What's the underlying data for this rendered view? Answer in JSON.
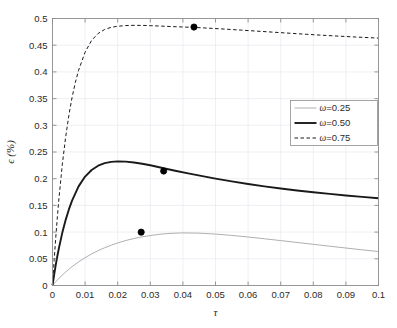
{
  "chart_data": {
    "type": "line",
    "title": "",
    "xlabel": "τ",
    "ylabel": "ϵ (%)",
    "xlim": [
      0,
      0.1
    ],
    "ylim": [
      0,
      0.5
    ],
    "grid": true,
    "legend_position": "center-right",
    "xticks": [
      "0",
      "0.01",
      "0.02",
      "0.03",
      "0.04",
      "0.05",
      "0.06",
      "0.07",
      "0.08",
      "0.09",
      "0.1"
    ],
    "xtick_values": [
      0,
      0.01,
      0.02,
      0.03,
      0.04,
      0.05,
      0.06,
      0.07,
      0.08,
      0.09,
      0.1
    ],
    "yticks": [
      "0",
      "0.05",
      "0.1",
      "0.15",
      "0.2",
      "0.25",
      "0.3",
      "0.35",
      "0.4",
      "0.45",
      "0.5"
    ],
    "ytick_values": [
      0,
      0.05,
      0.1,
      0.15,
      0.2,
      0.25,
      0.3,
      0.35,
      0.4,
      0.45,
      0.5
    ],
    "series": [
      {
        "name": "ω=0.25",
        "legend_label": "ω=0.25",
        "style": "thin-solid",
        "color": "#9a9a9a",
        "width": 0.8,
        "dash": "",
        "peak_marker": {
          "x": 0.0272,
          "y": 0.0999,
          "label": "peak"
        },
        "x": [
          0,
          0.0005,
          0.001,
          0.002,
          0.003,
          0.004,
          0.005,
          0.006,
          0.008,
          0.01,
          0.012,
          0.014,
          0.016,
          0.018,
          0.02,
          0.0225,
          0.025,
          0.0272,
          0.03,
          0.033,
          0.036,
          0.04,
          0.045,
          0.05,
          0.055,
          0.06,
          0.065,
          0.07,
          0.075,
          0.08,
          0.085,
          0.09,
          0.095,
          0.1
        ],
        "y": [
          0,
          0.0036,
          0.007,
          0.0134,
          0.0194,
          0.025,
          0.0303,
          0.0352,
          0.0442,
          0.0521,
          0.0591,
          0.0653,
          0.0707,
          0.0755,
          0.0797,
          0.0843,
          0.088,
          0.0908,
          0.0936,
          0.096,
          0.0976,
          0.0985,
          0.098,
          0.0963,
          0.0938,
          0.0908,
          0.0875,
          0.0841,
          0.0806,
          0.0771,
          0.0736,
          0.0702,
          0.0668,
          0.0636
        ]
      },
      {
        "name": "ω=0.50",
        "legend_label": "ω=0.50",
        "style": "thick-solid",
        "color": "#1a1a1a",
        "width": 1.9,
        "dash": "",
        "peak_marker": {
          "x": 0.0341,
          "y": 0.2143,
          "label": "peak"
        },
        "x": [
          0,
          0.0005,
          0.001,
          0.0015,
          0.002,
          0.003,
          0.004,
          0.005,
          0.006,
          0.008,
          0.01,
          0.012,
          0.014,
          0.016,
          0.018,
          0.02,
          0.0225,
          0.025,
          0.0275,
          0.03,
          0.0341,
          0.038,
          0.042,
          0.046,
          0.05,
          0.055,
          0.06,
          0.065,
          0.07,
          0.075,
          0.08,
          0.085,
          0.09,
          0.095,
          0.1
        ],
        "y": [
          0,
          0.02,
          0.0385,
          0.0554,
          0.071,
          0.0986,
          0.122,
          0.142,
          0.159,
          0.1856,
          0.204,
          0.2163,
          0.2243,
          0.2291,
          0.2316,
          0.2325,
          0.232,
          0.2304,
          0.228,
          0.2251,
          0.2196,
          0.2145,
          0.2095,
          0.2047,
          0.2001,
          0.1949,
          0.1901,
          0.1857,
          0.1817,
          0.178,
          0.1746,
          0.1715,
          0.1686,
          0.1659,
          0.1634
        ]
      },
      {
        "name": "ω=0.75",
        "legend_label": "ω=0.75",
        "style": "dashed",
        "color": "#1a1a1a",
        "width": 1.0,
        "dash": "3.5,2.5",
        "peak_marker": {
          "x": 0.0434,
          "y": 0.484,
          "label": "peak"
        },
        "x": [
          0,
          0.0005,
          0.001,
          0.0015,
          0.002,
          0.003,
          0.004,
          0.005,
          0.006,
          0.007,
          0.008,
          0.01,
          0.012,
          0.014,
          0.016,
          0.018,
          0.02,
          0.0225,
          0.025,
          0.0275,
          0.03,
          0.0335,
          0.037,
          0.0434,
          0.048,
          0.053,
          0.058,
          0.063,
          0.068,
          0.073,
          0.078,
          0.083,
          0.088,
          0.093,
          0.1
        ],
        "y": [
          0,
          0.047,
          0.09,
          0.129,
          0.1645,
          0.226,
          0.2765,
          0.318,
          0.352,
          0.38,
          0.403,
          0.437,
          0.459,
          0.472,
          0.4795,
          0.4835,
          0.4855,
          0.4868,
          0.4872,
          0.4871,
          0.4866,
          0.4857,
          0.4848,
          0.4833,
          0.4819,
          0.4801,
          0.4782,
          0.4762,
          0.4743,
          0.4723,
          0.4704,
          0.4686,
          0.4669,
          0.4653,
          0.4633
        ]
      }
    ],
    "marker": {
      "shape": "circle-filled",
      "color": "#000000",
      "size": 3.1
    }
  },
  "colors": {
    "background": "#ffffff",
    "axis": "#8d8d8d",
    "grid": "#e8eaef",
    "text": "#2b2b2b"
  }
}
